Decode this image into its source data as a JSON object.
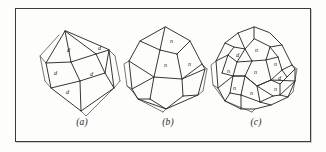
{
  "figure": {
    "background_color": "#fdfdfb",
    "frame_color": "#3a3a3a",
    "line_color": "#2b2b2b",
    "panels": [
      {
        "id": "a",
        "caption": "(a)",
        "form_name": "rhombic dodecahedron",
        "face_symbol": "d",
        "face_labels": [
          "d",
          "d",
          "d",
          "d",
          "d"
        ],
        "visible_face_count": 5
      },
      {
        "id": "b",
        "caption": "(b)",
        "form_name": "pentagonal dodecahedron",
        "face_symbol": "n",
        "face_labels": [
          "n",
          "n",
          "n"
        ],
        "visible_face_count": 3
      },
      {
        "id": "c",
        "caption": "(c)",
        "form_name": "combination of rhombic and pentagonal dodecahedron",
        "face_symbols": [
          "d",
          "n"
        ],
        "face_labels": [
          "d",
          "n",
          "n",
          "n",
          "d",
          "n",
          "n",
          "n",
          "n"
        ],
        "visible_face_count": 9
      }
    ]
  }
}
